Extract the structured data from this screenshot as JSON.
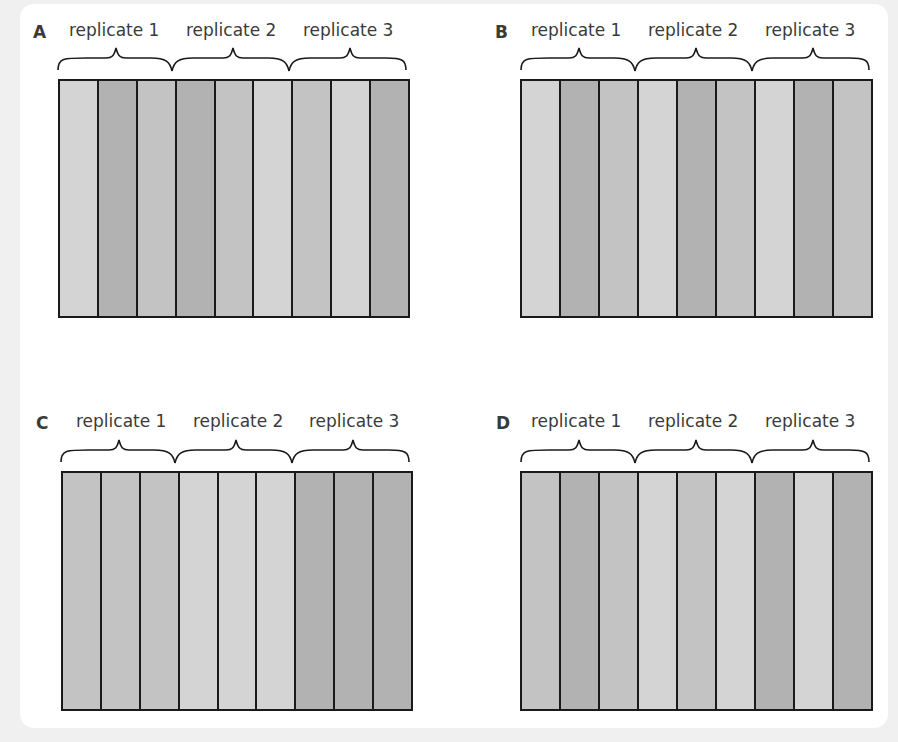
{
  "colors": {
    "light": "#d4d4d4",
    "medium": "#c3c3c3",
    "dark": "#b2b2b2",
    "border": "#1a1a1a",
    "text": "#3a3a3a"
  },
  "panels": [
    {
      "letter": "A",
      "replicates": [
        "replicate 1",
        "replicate 2",
        "replicate 3"
      ],
      "strips": [
        "light",
        "dark",
        "medium",
        "dark",
        "medium",
        "light",
        "medium",
        "light",
        "dark"
      ]
    },
    {
      "letter": "B",
      "replicates": [
        "replicate 1",
        "replicate 2",
        "replicate 3"
      ],
      "strips": [
        "light",
        "dark",
        "medium",
        "light",
        "dark",
        "medium",
        "light",
        "dark",
        "medium"
      ]
    },
    {
      "letter": "C",
      "replicates": [
        "replicate 1",
        "replicate 2",
        "replicate 3"
      ],
      "strips": [
        "medium",
        "medium",
        "medium",
        "light",
        "light",
        "light",
        "dark",
        "dark",
        "dark"
      ]
    },
    {
      "letter": "D",
      "replicates": [
        "replicate 1",
        "replicate 2",
        "replicate 3"
      ],
      "strips": [
        "medium",
        "dark",
        "medium",
        "light",
        "medium",
        "light",
        "dark",
        "light",
        "dark"
      ]
    }
  ]
}
